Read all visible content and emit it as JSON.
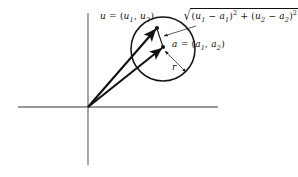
{
  "figure": {
    "background_color": "#ffffff",
    "axis_color": "#777777",
    "ink_color": "#111111"
  },
  "axes": {
    "origin": {
      "x": 88,
      "y": 107
    },
    "x_axis": {
      "x1": 18,
      "y1": 107,
      "x2": 218,
      "y2": 107
    },
    "y_axis": {
      "x1": 88,
      "y1": 13,
      "x2": 88,
      "y2": 165
    }
  },
  "points": {
    "u": {
      "x": 157,
      "y": 28,
      "label": "u"
    },
    "a": {
      "x": 163,
      "y": 47,
      "label": "a"
    }
  },
  "circle": {
    "center_x": 163,
    "center_y": 49,
    "radius": 32
  },
  "labels": {
    "u_point": {
      "name": "u",
      "equals": "=",
      "open": "(",
      "component1": "u",
      "component1_sub": "1",
      "comma": ",",
      "component2": "u",
      "component2_sub": "2",
      "close": ")"
    },
    "a_point": {
      "name": "a",
      "equals": "=",
      "open": "(",
      "component1": "a",
      "component1_sub": "1",
      "comma": ",",
      "component2": "a",
      "component2_sub": "2",
      "close": ")"
    },
    "radius": "r",
    "distance": {
      "radical": "√",
      "term1_open": "(",
      "term1_var1": "u",
      "term1_sub1": "1",
      "term1_minus": "−",
      "term1_var2": "a",
      "term1_sub2": "1",
      "term1_close": ")",
      "term1_exp": "2",
      "plus": "+",
      "term2_open": "(",
      "term2_var1": "u",
      "term2_sub1": "2",
      "term2_minus": "−",
      "term2_var2": "a",
      "term2_sub2": "2",
      "term2_close": ")",
      "term2_exp": "2"
    }
  },
  "vectors": [
    {
      "name": "vector-to-u",
      "from_x": 88,
      "from_y": 107,
      "to_x": 157,
      "to_y": 28
    },
    {
      "name": "vector-to-a",
      "from_x": 88,
      "from_y": 107,
      "to_x": 163,
      "to_y": 47
    }
  ],
  "leaders": [
    {
      "name": "distance-leader",
      "from_x": 196,
      "from_y": 26,
      "to_x": 163,
      "to_y": 36
    },
    {
      "name": "radius-leader",
      "from_x": 164,
      "from_y": 50,
      "to_x": 186,
      "to_y": 72
    }
  ]
}
